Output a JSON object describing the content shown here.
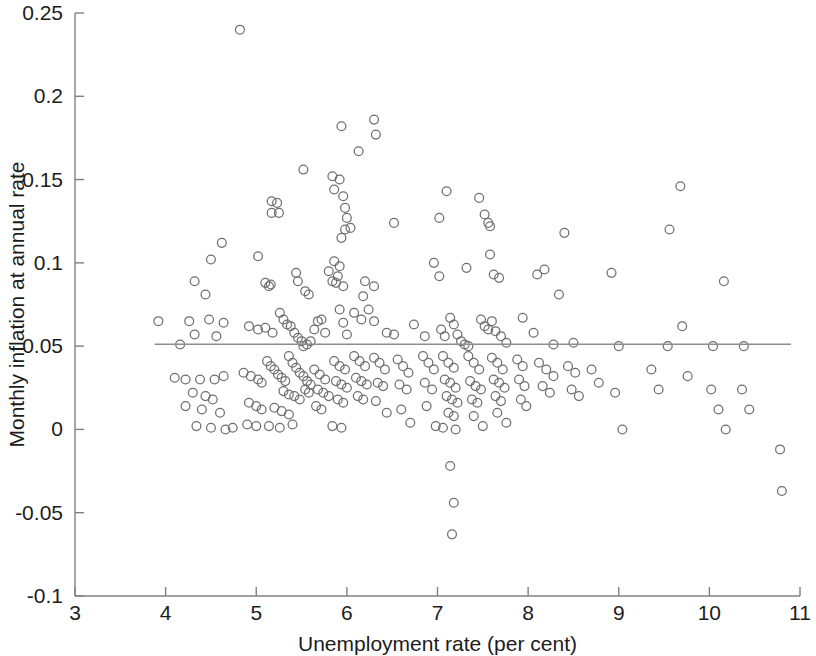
{
  "figure": {
    "background": "#ffffff",
    "plot_area": {
      "left": 75,
      "right": 800,
      "top": 13,
      "bottom": 596
    }
  },
  "chart_data": {
    "type": "scatter",
    "title": "",
    "subtitle": "",
    "xlabel": "Unemployment rate (per cent)",
    "ylabel": "Monthly inflation at annual rate",
    "xlim": [
      3,
      11
    ],
    "ylim": [
      -0.1,
      0.25
    ],
    "xticks": [
      3,
      4,
      5,
      6,
      7,
      8,
      9,
      10,
      11
    ],
    "xticklabels": [
      "3",
      "4",
      "5",
      "6",
      "7",
      "8",
      "9",
      "10",
      "11"
    ],
    "yticks": [
      -0.1,
      -0.05,
      0,
      0.05,
      0.1,
      0.15,
      0.2,
      0.25
    ],
    "yticklabels": [
      "-0.1",
      "-0.05",
      "0",
      "0.05",
      "0.1",
      "0.15",
      "0.2",
      "0.25"
    ],
    "grid": false,
    "legend": null,
    "marker": {
      "shape": "circle-open",
      "radius": 4.4,
      "stroke": "#6f6f6f",
      "fill": "none",
      "stroke_width": 1.25
    },
    "annotations": [],
    "series": [
      {
        "name": "Monthly inflation vs unemployment",
        "marker": "circle-open",
        "color": "#6f6f6f",
        "points": [
          [
            4.82,
            0.24
          ],
          [
            5.94,
            0.182
          ],
          [
            6.3,
            0.186
          ],
          [
            6.32,
            0.177
          ],
          [
            6.13,
            0.167
          ],
          [
            5.52,
            0.156
          ],
          [
            5.84,
            0.152
          ],
          [
            5.92,
            0.15
          ],
          [
            5.17,
            0.137
          ],
          [
            5.23,
            0.136
          ],
          [
            5.17,
            0.13
          ],
          [
            5.25,
            0.13
          ],
          [
            5.86,
            0.144
          ],
          [
            5.96,
            0.14
          ],
          [
            5.98,
            0.133
          ],
          [
            6.0,
            0.127
          ],
          [
            6.04,
            0.121
          ],
          [
            5.98,
            0.12
          ],
          [
            5.94,
            0.115
          ],
          [
            9.68,
            0.146
          ],
          [
            9.56,
            0.12
          ],
          [
            8.4,
            0.118
          ],
          [
            7.46,
            0.139
          ],
          [
            7.52,
            0.129
          ],
          [
            7.56,
            0.124
          ],
          [
            7.58,
            0.122
          ],
          [
            7.1,
            0.143
          ],
          [
            7.02,
            0.127
          ],
          [
            6.52,
            0.124
          ],
          [
            4.62,
            0.112
          ],
          [
            4.5,
            0.102
          ],
          [
            5.02,
            0.104
          ],
          [
            5.1,
            0.088
          ],
          [
            5.16,
            0.087
          ],
          [
            5.14,
            0.086
          ],
          [
            4.32,
            0.089
          ],
          [
            4.44,
            0.081
          ],
          [
            5.86,
            0.101
          ],
          [
            5.92,
            0.098
          ],
          [
            5.8,
            0.095
          ],
          [
            5.9,
            0.092
          ],
          [
            5.84,
            0.089
          ],
          [
            5.88,
            0.088
          ],
          [
            5.96,
            0.086
          ],
          [
            5.44,
            0.094
          ],
          [
            5.46,
            0.089
          ],
          [
            5.54,
            0.083
          ],
          [
            5.58,
            0.081
          ],
          [
            6.2,
            0.089
          ],
          [
            6.3,
            0.086
          ],
          [
            6.18,
            0.08
          ],
          [
            6.96,
            0.1
          ],
          [
            7.02,
            0.092
          ],
          [
            7.32,
            0.097
          ],
          [
            7.58,
            0.105
          ],
          [
            7.62,
            0.093
          ],
          [
            7.68,
            0.091
          ],
          [
            8.18,
            0.096
          ],
          [
            8.1,
            0.093
          ],
          [
            8.34,
            0.081
          ],
          [
            8.92,
            0.094
          ],
          [
            10.16,
            0.089
          ],
          [
            3.92,
            0.065
          ],
          [
            4.26,
            0.065
          ],
          [
            4.48,
            0.066
          ],
          [
            4.64,
            0.064
          ],
          [
            4.16,
            0.051
          ],
          [
            4.32,
            0.057
          ],
          [
            4.56,
            0.056
          ],
          [
            4.92,
            0.062
          ],
          [
            5.02,
            0.06
          ],
          [
            5.1,
            0.061
          ],
          [
            5.18,
            0.058
          ],
          [
            5.26,
            0.07
          ],
          [
            5.3,
            0.066
          ],
          [
            5.34,
            0.063
          ],
          [
            5.38,
            0.062
          ],
          [
            5.42,
            0.058
          ],
          [
            5.46,
            0.055
          ],
          [
            5.5,
            0.053
          ],
          [
            5.52,
            0.05
          ],
          [
            5.56,
            0.051
          ],
          [
            5.6,
            0.053
          ],
          [
            5.64,
            0.06
          ],
          [
            5.68,
            0.065
          ],
          [
            5.72,
            0.066
          ],
          [
            5.76,
            0.058
          ],
          [
            5.92,
            0.072
          ],
          [
            5.96,
            0.064
          ],
          [
            6.0,
            0.057
          ],
          [
            6.08,
            0.07
          ],
          [
            6.16,
            0.066
          ],
          [
            6.24,
            0.072
          ],
          [
            6.3,
            0.065
          ],
          [
            6.44,
            0.058
          ],
          [
            6.52,
            0.057
          ],
          [
            6.74,
            0.063
          ],
          [
            6.86,
            0.056
          ],
          [
            7.04,
            0.06
          ],
          [
            7.08,
            0.056
          ],
          [
            7.14,
            0.067
          ],
          [
            7.18,
            0.063
          ],
          [
            7.22,
            0.057
          ],
          [
            7.26,
            0.053
          ],
          [
            7.3,
            0.051
          ],
          [
            7.34,
            0.05
          ],
          [
            7.48,
            0.066
          ],
          [
            7.52,
            0.062
          ],
          [
            7.56,
            0.06
          ],
          [
            7.6,
            0.065
          ],
          [
            7.64,
            0.059
          ],
          [
            7.7,
            0.056
          ],
          [
            7.76,
            0.052
          ],
          [
            7.94,
            0.067
          ],
          [
            8.06,
            0.058
          ],
          [
            8.28,
            0.051
          ],
          [
            8.5,
            0.052
          ],
          [
            9.0,
            0.05
          ],
          [
            9.54,
            0.05
          ],
          [
            10.04,
            0.05
          ],
          [
            10.38,
            0.05
          ],
          [
            4.1,
            0.031
          ],
          [
            4.22,
            0.03
          ],
          [
            4.38,
            0.03
          ],
          [
            4.54,
            0.03
          ],
          [
            4.64,
            0.032
          ],
          [
            4.3,
            0.022
          ],
          [
            4.44,
            0.02
          ],
          [
            4.52,
            0.018
          ],
          [
            4.22,
            0.014
          ],
          [
            4.4,
            0.012
          ],
          [
            4.6,
            0.01
          ],
          [
            4.34,
            0.002
          ],
          [
            4.5,
            0.001
          ],
          [
            4.66,
            0.0
          ],
          [
            4.74,
            0.001
          ],
          [
            4.86,
            0.034
          ],
          [
            4.94,
            0.032
          ],
          [
            5.02,
            0.03
          ],
          [
            5.06,
            0.028
          ],
          [
            5.12,
            0.041
          ],
          [
            5.16,
            0.038
          ],
          [
            5.2,
            0.036
          ],
          [
            5.24,
            0.033
          ],
          [
            5.28,
            0.031
          ],
          [
            5.32,
            0.029
          ],
          [
            5.36,
            0.044
          ],
          [
            5.4,
            0.04
          ],
          [
            5.44,
            0.037
          ],
          [
            5.48,
            0.034
          ],
          [
            5.52,
            0.032
          ],
          [
            5.56,
            0.029
          ],
          [
            5.6,
            0.027
          ],
          [
            5.3,
            0.023
          ],
          [
            5.36,
            0.021
          ],
          [
            5.42,
            0.02
          ],
          [
            5.48,
            0.018
          ],
          [
            5.54,
            0.024
          ],
          [
            5.58,
            0.022
          ],
          [
            5.2,
            0.013
          ],
          [
            5.28,
            0.011
          ],
          [
            5.36,
            0.009
          ],
          [
            5.14,
            0.002
          ],
          [
            5.26,
            0.001
          ],
          [
            5.4,
            0.003
          ],
          [
            4.92,
            0.016
          ],
          [
            5.0,
            0.014
          ],
          [
            5.06,
            0.012
          ],
          [
            4.9,
            0.003
          ],
          [
            5.0,
            0.002
          ],
          [
            5.64,
            0.036
          ],
          [
            5.7,
            0.033
          ],
          [
            5.76,
            0.03
          ],
          [
            5.68,
            0.024
          ],
          [
            5.74,
            0.022
          ],
          [
            5.8,
            0.02
          ],
          [
            5.66,
            0.014
          ],
          [
            5.72,
            0.012
          ],
          [
            5.86,
            0.041
          ],
          [
            5.92,
            0.038
          ],
          [
            5.98,
            0.036
          ],
          [
            5.88,
            0.029
          ],
          [
            5.94,
            0.027
          ],
          [
            6.0,
            0.025
          ],
          [
            5.9,
            0.018
          ],
          [
            5.96,
            0.016
          ],
          [
            5.84,
            0.002
          ],
          [
            5.94,
            0.001
          ],
          [
            6.08,
            0.044
          ],
          [
            6.14,
            0.041
          ],
          [
            6.2,
            0.038
          ],
          [
            6.1,
            0.031
          ],
          [
            6.16,
            0.029
          ],
          [
            6.22,
            0.027
          ],
          [
            6.12,
            0.02
          ],
          [
            6.18,
            0.018
          ],
          [
            6.3,
            0.043
          ],
          [
            6.36,
            0.04
          ],
          [
            6.42,
            0.036
          ],
          [
            6.34,
            0.028
          ],
          [
            6.4,
            0.026
          ],
          [
            6.32,
            0.017
          ],
          [
            6.44,
            0.01
          ],
          [
            6.56,
            0.042
          ],
          [
            6.62,
            0.038
          ],
          [
            6.68,
            0.034
          ],
          [
            6.58,
            0.027
          ],
          [
            6.66,
            0.024
          ],
          [
            6.6,
            0.012
          ],
          [
            6.7,
            0.004
          ],
          [
            6.84,
            0.044
          ],
          [
            6.9,
            0.04
          ],
          [
            6.96,
            0.036
          ],
          [
            6.86,
            0.028
          ],
          [
            6.94,
            0.024
          ],
          [
            6.88,
            0.014
          ],
          [
            6.98,
            0.002
          ],
          [
            7.06,
            0.044
          ],
          [
            7.12,
            0.04
          ],
          [
            7.18,
            0.037
          ],
          [
            7.08,
            0.03
          ],
          [
            7.14,
            0.028
          ],
          [
            7.2,
            0.025
          ],
          [
            7.1,
            0.02
          ],
          [
            7.16,
            0.018
          ],
          [
            7.22,
            0.016
          ],
          [
            7.12,
            0.01
          ],
          [
            7.18,
            0.008
          ],
          [
            7.06,
            0.001
          ],
          [
            7.2,
            0.0
          ],
          [
            7.34,
            0.044
          ],
          [
            7.4,
            0.04
          ],
          [
            7.46,
            0.036
          ],
          [
            7.36,
            0.029
          ],
          [
            7.42,
            0.026
          ],
          [
            7.48,
            0.024
          ],
          [
            7.38,
            0.018
          ],
          [
            7.44,
            0.016
          ],
          [
            7.4,
            0.008
          ],
          [
            7.5,
            0.002
          ],
          [
            7.6,
            0.043
          ],
          [
            7.66,
            0.04
          ],
          [
            7.72,
            0.036
          ],
          [
            7.62,
            0.03
          ],
          [
            7.68,
            0.028
          ],
          [
            7.74,
            0.025
          ],
          [
            7.64,
            0.02
          ],
          [
            7.7,
            0.017
          ],
          [
            7.66,
            0.01
          ],
          [
            7.76,
            0.004
          ],
          [
            7.88,
            0.042
          ],
          [
            7.94,
            0.038
          ],
          [
            7.9,
            0.03
          ],
          [
            7.96,
            0.026
          ],
          [
            7.92,
            0.018
          ],
          [
            7.98,
            0.014
          ],
          [
            8.12,
            0.04
          ],
          [
            8.2,
            0.036
          ],
          [
            8.28,
            0.032
          ],
          [
            8.16,
            0.026
          ],
          [
            8.24,
            0.022
          ],
          [
            8.44,
            0.038
          ],
          [
            8.52,
            0.034
          ],
          [
            8.48,
            0.024
          ],
          [
            8.56,
            0.02
          ],
          [
            8.7,
            0.036
          ],
          [
            8.78,
            0.028
          ],
          [
            8.96,
            0.022
          ],
          [
            9.04,
            0.0
          ],
          [
            9.36,
            0.036
          ],
          [
            9.44,
            0.024
          ],
          [
            9.7,
            0.062
          ],
          [
            9.76,
            0.032
          ],
          [
            10.02,
            0.024
          ],
          [
            10.1,
            0.012
          ],
          [
            10.18,
            0.0
          ],
          [
            10.36,
            0.024
          ],
          [
            10.44,
            0.012
          ],
          [
            10.78,
            -0.012
          ],
          [
            10.8,
            -0.037
          ],
          [
            7.14,
            -0.022
          ],
          [
            7.18,
            -0.044
          ],
          [
            7.16,
            -0.063
          ]
        ]
      }
    ],
    "fit_line": {
      "name": "regression-line",
      "type": "horizontal",
      "y": 0.0512,
      "x_start": 3.88,
      "x_end": 10.9,
      "color": "#8d8d8d",
      "width": 1.5
    }
  }
}
